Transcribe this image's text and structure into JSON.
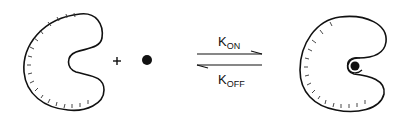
{
  "diagram": {
    "left": {
      "receptor": "unbound receptor (C-shaped)",
      "operator": "+",
      "ligand": "ligand (filled dot)"
    },
    "equilibrium": {
      "forward_label": {
        "main": "K",
        "sub": "ON"
      },
      "reverse_label": {
        "main": "K",
        "sub": "OFF"
      }
    },
    "right": {
      "complex": "receptor-ligand complex"
    },
    "colors": {
      "stroke": "#111111",
      "background": "#ffffff"
    }
  }
}
